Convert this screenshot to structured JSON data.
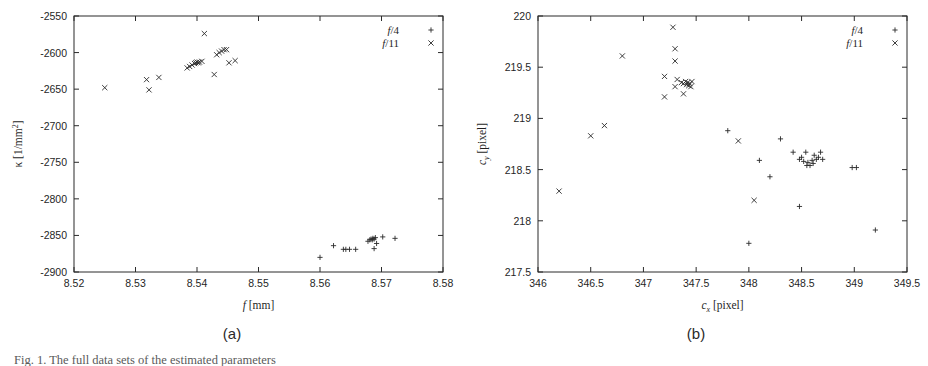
{
  "figure": {
    "caption_fragment": "Fig. 1. The full data sets of the estimated parameters",
    "panels": [
      {
        "id": "a",
        "label": "(a)"
      },
      {
        "id": "b",
        "label": "(b)"
      }
    ]
  },
  "legend": {
    "entries": [
      {
        "label": "f/4",
        "marker": "plus-marker",
        "symbol": "+"
      },
      {
        "label": "f/11",
        "marker": "cross-marker",
        "symbol": "×"
      }
    ]
  },
  "chart_data": [
    {
      "type": "scatter",
      "panel": "a",
      "title": "(a)",
      "xlabel": "f [mm]",
      "ylabel": "κ [1/mm²]",
      "xlim": [
        8.52,
        8.58
      ],
      "ylim": [
        -2900,
        -2550
      ],
      "xticks": [
        8.52,
        8.53,
        8.54,
        8.55,
        8.56,
        8.57,
        8.58
      ],
      "xticklabels": [
        "8.52",
        "8.53",
        "8.54",
        "8.55",
        "8.56",
        "8.57",
        "8.58"
      ],
      "yticks": [
        -2900,
        -2850,
        -2800,
        -2750,
        -2700,
        -2650,
        -2600,
        -2550
      ],
      "yticklabels": [
        "-2900",
        "-2850",
        "-2800",
        "-2750",
        "-2700",
        "-2650",
        "-2600",
        "-2550"
      ],
      "grid": false,
      "legend_position": "top-right",
      "series": [
        {
          "name": "f/4",
          "marker": "+",
          "points": [
            [
              8.56,
              -2880
            ],
            [
              8.5622,
              -2864
            ],
            [
              8.5638,
              -2869
            ],
            [
              8.5642,
              -2869
            ],
            [
              8.5648,
              -2869
            ],
            [
              8.5658,
              -2869
            ],
            [
              8.5678,
              -2858
            ],
            [
              8.5681,
              -2856
            ],
            [
              8.5683,
              -2855
            ],
            [
              8.5685,
              -2856
            ],
            [
              8.5686,
              -2854
            ],
            [
              8.5688,
              -2855
            ],
            [
              8.569,
              -2853
            ],
            [
              8.5688,
              -2868
            ],
            [
              8.5692,
              -2861
            ],
            [
              8.5702,
              -2852
            ],
            [
              8.5722,
              -2854
            ]
          ]
        },
        {
          "name": "f/11",
          "marker": "×",
          "points": [
            [
              8.525,
              -2648
            ],
            [
              8.5318,
              -2637
            ],
            [
              8.5322,
              -2651
            ],
            [
              8.5338,
              -2634
            ],
            [
              8.5384,
              -2621
            ],
            [
              8.5388,
              -2619
            ],
            [
              8.5392,
              -2617
            ],
            [
              8.5396,
              -2615
            ],
            [
              8.5398,
              -2614
            ],
            [
              8.54,
              -2613
            ],
            [
              8.5402,
              -2614
            ],
            [
              8.5404,
              -2613
            ],
            [
              8.5408,
              -2612
            ],
            [
              8.5412,
              -2574
            ],
            [
              8.5428,
              -2630
            ],
            [
              8.5432,
              -2603
            ],
            [
              8.5436,
              -2600
            ],
            [
              8.544,
              -2598
            ],
            [
              8.5444,
              -2596
            ],
            [
              8.5448,
              -2596
            ],
            [
              8.5452,
              -2614
            ],
            [
              8.5462,
              -2611
            ]
          ]
        }
      ]
    },
    {
      "type": "scatter",
      "panel": "b",
      "title": "(b)",
      "xlabel": "c_x [pixel]",
      "ylabel": "c_y [pixel]",
      "xlim": [
        346,
        349.5
      ],
      "ylim": [
        217.5,
        220
      ],
      "xticks": [
        346,
        346.5,
        347,
        347.5,
        348,
        348.5,
        349,
        349.5
      ],
      "xticklabels": [
        "346",
        "346.5",
        "347",
        "347.5",
        "348",
        "348.5",
        "349",
        "349.5"
      ],
      "yticks": [
        217.5,
        218,
        218.5,
        219,
        219.5,
        220
      ],
      "yticklabels": [
        "217.5",
        "218",
        "218.5",
        "219",
        "219.5",
        "220"
      ],
      "grid": false,
      "legend_position": "top-right",
      "series": [
        {
          "name": "f/4",
          "marker": "+",
          "points": [
            [
              347.8,
              218.88
            ],
            [
              348.0,
              217.78
            ],
            [
              348.1,
              218.59
            ],
            [
              348.2,
              218.43
            ],
            [
              348.3,
              218.8
            ],
            [
              348.48,
              218.6
            ],
            [
              348.48,
              218.14
            ],
            [
              348.5,
              218.62
            ],
            [
              348.52,
              218.58
            ],
            [
              348.54,
              218.67
            ],
            [
              348.55,
              218.54
            ],
            [
              348.56,
              218.57
            ],
            [
              348.58,
              218.54
            ],
            [
              348.6,
              218.59
            ],
            [
              348.61,
              218.56
            ],
            [
              348.62,
              218.64
            ],
            [
              348.64,
              218.6
            ],
            [
              348.66,
              218.62
            ],
            [
              348.68,
              218.67
            ],
            [
              348.7,
              218.6
            ],
            [
              348.42,
              218.67
            ],
            [
              348.98,
              218.52
            ],
            [
              349.02,
              218.52
            ],
            [
              349.2,
              217.91
            ]
          ]
        },
        {
          "name": "f/11",
          "marker": "×",
          "points": [
            [
              346.2,
              218.29
            ],
            [
              346.5,
              218.83
            ],
            [
              346.63,
              218.93
            ],
            [
              346.8,
              219.61
            ],
            [
              347.2,
              219.41
            ],
            [
              347.2,
              219.21
            ],
            [
              347.28,
              219.89
            ],
            [
              347.3,
              219.68
            ],
            [
              347.3,
              219.56
            ],
            [
              347.3,
              219.31
            ],
            [
              347.32,
              219.38
            ],
            [
              347.36,
              219.35
            ],
            [
              347.38,
              219.34
            ],
            [
              347.38,
              219.24
            ],
            [
              347.4,
              219.36
            ],
            [
              347.41,
              219.33
            ],
            [
              347.42,
              219.35
            ],
            [
              347.43,
              219.32
            ],
            [
              347.44,
              219.34
            ],
            [
              347.45,
              219.31
            ],
            [
              347.46,
              219.36
            ],
            [
              347.9,
              218.78
            ],
            [
              348.05,
              218.2
            ]
          ]
        }
      ]
    }
  ]
}
